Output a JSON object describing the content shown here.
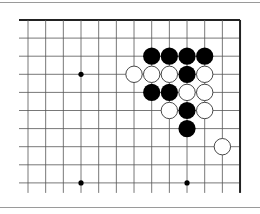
{
  "diagram": {
    "type": "go-board-fragment",
    "columns": 13,
    "rows": 10,
    "edges": [
      "top",
      "right"
    ],
    "origin": {
      "x": 28,
      "y": 20
    },
    "spacing": {
      "x": 17.67,
      "y": 18.1
    },
    "colors": {
      "line": "#555555",
      "edge": "#222222",
      "black": "#000000",
      "white": "#ffffff",
      "stone_outline": "#333333"
    },
    "hoshi": [
      [
        3,
        3
      ],
      [
        3,
        9
      ],
      [
        9,
        9
      ]
    ],
    "stones": {
      "black": [
        [
          7,
          2
        ],
        [
          8,
          2
        ],
        [
          9,
          2
        ],
        [
          10,
          2
        ],
        [
          9,
          3
        ],
        [
          7,
          4
        ],
        [
          8,
          4
        ],
        [
          9,
          5
        ],
        [
          9,
          6
        ]
      ],
      "white": [
        [
          6,
          3
        ],
        [
          7,
          3
        ],
        [
          8,
          3
        ],
        [
          10,
          3
        ],
        [
          9,
          4
        ],
        [
          10,
          4
        ],
        [
          8,
          5
        ],
        [
          10,
          5
        ],
        [
          11,
          7
        ]
      ]
    }
  }
}
